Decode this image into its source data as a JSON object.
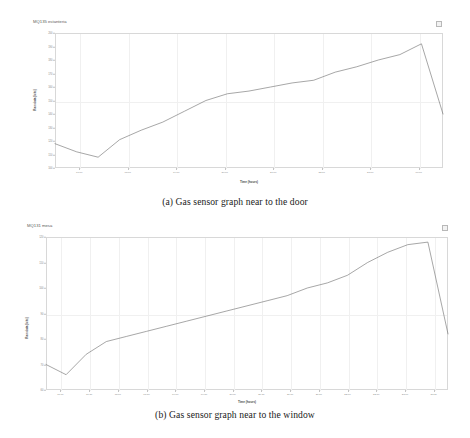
{
  "figure": {
    "captions": [
      "(a) Gas sensor graph near to the door",
      "(b) Gas sensor graph near to the window"
    ]
  },
  "chart_data": [
    {
      "type": "line",
      "title": "MQ135 estanteria",
      "xlabel": "Time (hours)",
      "ylabel": "Raw data (bits)",
      "grid": true,
      "legend_position": "top-right",
      "legend_marker": "series-swatch",
      "ylim": [
        100,
        200
      ],
      "yticks": [
        100,
        110,
        120,
        130,
        140,
        150,
        160,
        170,
        180,
        190,
        200
      ],
      "ytick_labels": [
        "100",
        "110",
        "120",
        "130",
        "140",
        "150",
        "160",
        "170",
        "180",
        "190",
        "200"
      ],
      "xticks": [
        "17:00",
        "18:00",
        "19:00",
        "20:00",
        "21:00",
        "22:00",
        "23:00",
        "00:00"
      ],
      "x": [
        0,
        1,
        2,
        3,
        4,
        5,
        6,
        7,
        8,
        9,
        10,
        11,
        12,
        13,
        14,
        15,
        16,
        17,
        18
      ],
      "values": [
        118,
        112,
        108,
        121,
        128,
        134,
        142,
        150,
        155,
        157,
        160,
        163,
        165,
        171,
        175,
        180,
        184,
        192,
        140
      ]
    },
    {
      "type": "line",
      "title": "MQ131 mesa",
      "xlabel": "Time (hours)",
      "ylabel": "Raw data (bits)",
      "grid": true,
      "legend_position": "top-right",
      "legend_marker": "series-swatch",
      "ylim": [
        60,
        120
      ],
      "yticks": [
        60,
        70,
        80,
        90,
        100,
        110,
        120
      ],
      "ytick_labels": [
        "60",
        "70",
        "80",
        "90",
        "100",
        "110",
        "120"
      ],
      "xticks": [
        "17:00",
        "17:30",
        "18:00",
        "18:30",
        "19:00",
        "19:30",
        "20:00",
        "20:30",
        "21:00",
        "21:30",
        "22:00",
        "22:30",
        "23:00",
        "23:30"
      ],
      "x": [
        0,
        1,
        2,
        3,
        4,
        5,
        6,
        7,
        8,
        9,
        10,
        11,
        12,
        13,
        14,
        15,
        16,
        17,
        18,
        19,
        20
      ],
      "values": [
        70,
        66,
        74,
        79,
        81,
        83,
        85,
        87,
        89,
        91,
        93,
        95,
        97,
        100,
        102,
        105,
        110,
        114,
        117,
        118,
        82
      ]
    }
  ]
}
